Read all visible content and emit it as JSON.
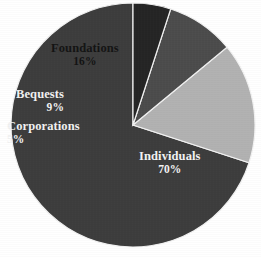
{
  "chart_data": {
    "type": "pie",
    "title": "",
    "categories": [
      "Individuals",
      "Foundations",
      "Bequests",
      "Corporations"
    ],
    "values": [
      70,
      16,
      9,
      5
    ],
    "value_labels": [
      "70%",
      "16%",
      "9%",
      "5%"
    ],
    "unit": "%",
    "legend": "none",
    "grid": false,
    "start_angle_deg": 90,
    "direction": "counterclockwise",
    "slices": [
      {
        "label": "Individuals",
        "value": 70,
        "value_label": "70%",
        "color": "#3d3d3d",
        "text_color": "#f4f4f4"
      },
      {
        "label": "Foundations",
        "value": 16,
        "value_label": "16%",
        "color": "#b2b2b2",
        "text_color": "#141414"
      },
      {
        "label": "Bequests",
        "value": 9,
        "value_label": "9%",
        "color": "#4c4c4c",
        "text_color": "#f2f2f2"
      },
      {
        "label": "Corporations",
        "value": 5,
        "value_label": "5%",
        "color": "#252525",
        "text_color": "#f2f2f2"
      }
    ],
    "background_color": "#ffffff",
    "separator_color": "#f2f2f2"
  },
  "labels": {
    "individuals": {
      "name": "Individuals",
      "pct": "70%"
    },
    "foundations": {
      "name": "Foundations",
      "pct": "16%"
    },
    "bequests": {
      "name": "Bequests",
      "pct": "9%"
    },
    "corporations": {
      "name": "Corporations",
      "pct": "5%"
    }
  }
}
